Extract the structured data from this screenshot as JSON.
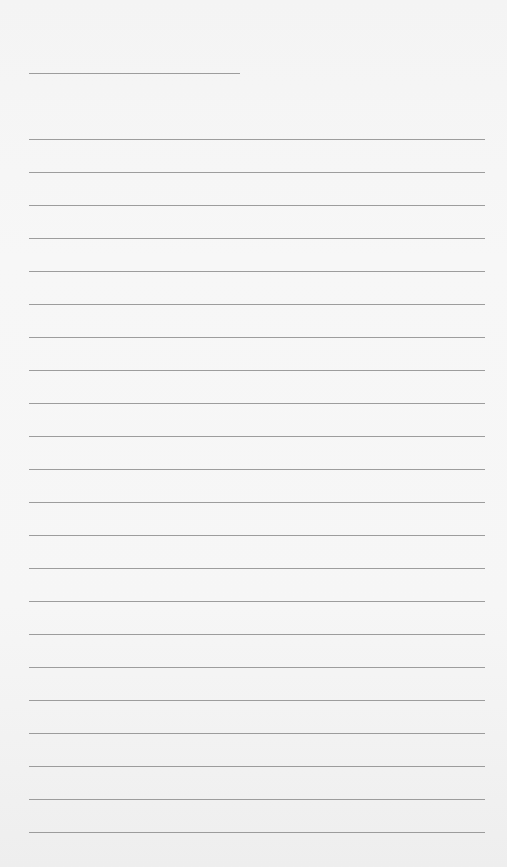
{
  "page": {
    "type": "lined-paper",
    "background_color": "#f6f6f6",
    "line_color": "#8d8d8d",
    "header_line": {
      "x": 29,
      "y": 73,
      "width": 211
    },
    "rules": {
      "count": 22,
      "first_y": 139,
      "spacing": 33,
      "left": 29,
      "right": 485
    }
  }
}
